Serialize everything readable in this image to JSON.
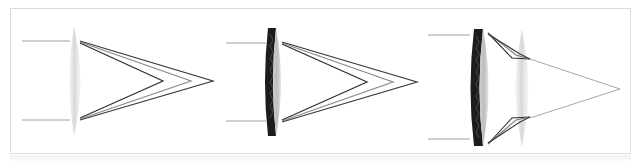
{
  "figure": {
    "colors": {
      "frame_border": "#dcdcdc",
      "incident_ray": "#9a9a9a",
      "ray_dark": "#3a3a3a",
      "ray_mid": "#7a7a7a",
      "ray_light": "#b0b0b0",
      "lens_light": "#e6e6e6",
      "lens_dark": "#1e1e1e",
      "focused_ray": "#a8a8a8"
    },
    "panels": [
      {
        "name": "single-lens",
        "lens_type": "simple convex lens",
        "incident_rays_y": [
          41,
          120
        ],
        "lens_x": 74,
        "focal_points_x": [
          163,
          191,
          213
        ],
        "focal_y": 81
      },
      {
        "name": "achromatic-doublet",
        "lens_type": "doublet lens (dark flint + crown)",
        "incident_rays_y": [
          42,
          121
        ],
        "lens_x": 275,
        "focal_points_x": [
          367,
          393,
          417
        ],
        "focal_y": 82
      },
      {
        "name": "corrected-system",
        "lens_type": "doublet plus secondary convex lens",
        "incident_rays_y": [
          35,
          139
        ],
        "lens_x": 482,
        "secondary_lens_x": 522,
        "focal_points_x": [
          620
        ],
        "focal_y": 89
      }
    ]
  }
}
